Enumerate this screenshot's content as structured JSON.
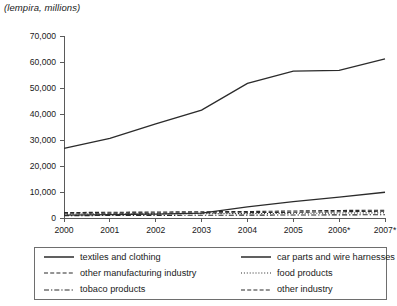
{
  "chart_data": {
    "type": "line",
    "title": "(lempira, millions)",
    "xlabel": "",
    "ylabel": "",
    "categories": [
      "2000",
      "2001",
      "2002",
      "2003",
      "2004",
      "2005",
      "2006*",
      "2007*"
    ],
    "x": [
      2000,
      2001,
      2002,
      2003,
      2004,
      2005,
      2006,
      2007
    ],
    "ylim": [
      0,
      70000
    ],
    "ytick_values": [
      0,
      10000,
      20000,
      30000,
      40000,
      50000,
      60000,
      70000
    ],
    "ytick_labels": [
      "0",
      "10,000",
      "20,000",
      "30,000",
      "40,000",
      "50,000",
      "60,000",
      "70,000"
    ],
    "grid": false,
    "legend_position": "bottom",
    "legend_columns": 2,
    "series": [
      {
        "name": "textiles and clothing",
        "style": "solid",
        "values": [
          26800,
          30600,
          36200,
          41500,
          51800,
          56500,
          56800,
          61200
        ]
      },
      {
        "name": "car parts and wire harnesses",
        "style": "solid",
        "values": [
          1100,
          1300,
          1500,
          1900,
          4300,
          6300,
          8000,
          9900
        ]
      },
      {
        "name": "other manufacturing industry",
        "style": "dashed",
        "values": [
          2100,
          2200,
          2300,
          2400,
          2500,
          2700,
          2900,
          3000
        ]
      },
      {
        "name": "food products",
        "style": "dotted",
        "values": [
          1500,
          1550,
          1600,
          1650,
          1700,
          1800,
          1900,
          2000
        ]
      },
      {
        "name": "tobaco products",
        "style": "dash-dot",
        "values": [
          900,
          950,
          1000,
          1050,
          1100,
          1150,
          1200,
          1250
        ]
      },
      {
        "name": "other industry",
        "style": "dashed",
        "values": [
          1800,
          1850,
          1900,
          1950,
          2050,
          2200,
          2400,
          2600
        ]
      }
    ]
  },
  "legend": {
    "entries": [
      {
        "label": "textiles and clothing",
        "swatch": "solid-line-swatch"
      },
      {
        "label": "car parts and wire harnesses",
        "swatch": "solid-line-swatch"
      },
      {
        "label": "other manufacturing industry",
        "swatch": "dashed-line-swatch"
      },
      {
        "label": "food products",
        "swatch": "dotted-line-swatch"
      },
      {
        "label": "tobaco products",
        "swatch": "dash-dot-line-swatch"
      },
      {
        "label": "other industry",
        "swatch": "dashed-line-swatch"
      }
    ]
  }
}
